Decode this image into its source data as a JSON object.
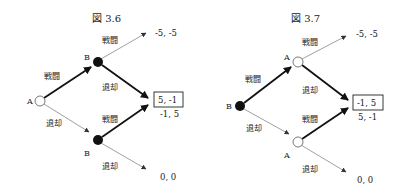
{
  "figures": [
    {
      "title": "図 3.6",
      "root": {
        "label": "A",
        "type": "open"
      },
      "root_edges": [
        {
          "label": "戦闘",
          "bold": true
        },
        {
          "label": "退却",
          "bold": false
        }
      ],
      "upper_node": {
        "label": "B",
        "type": "filled"
      },
      "lower_node": {
        "label": "B",
        "type": "filled"
      },
      "upper_edges": [
        {
          "label": "戦闘",
          "bold": false,
          "payoff": "-5, -5"
        },
        {
          "label": "退却",
          "bold": true,
          "payoff": "5, -1",
          "boxed": true
        }
      ],
      "lower_edges": [
        {
          "label": "戦闘",
          "bold": true,
          "payoff": "-1, 5"
        },
        {
          "label": "退却",
          "bold": false,
          "payoff": "0, 0"
        }
      ]
    },
    {
      "title": "図 3.7",
      "root": {
        "label": "B",
        "type": "filled"
      },
      "root_edges": [
        {
          "label": "戦闘",
          "bold": true
        },
        {
          "label": "退却",
          "bold": false
        }
      ],
      "upper_node": {
        "label": "A",
        "type": "open"
      },
      "lower_node": {
        "label": "A",
        "type": "open"
      },
      "upper_edges": [
        {
          "label": "戦闘",
          "bold": false,
          "payoff": "-5, -5"
        },
        {
          "label": "退却",
          "bold": true,
          "payoff": "-1, 5",
          "boxed": true
        }
      ],
      "lower_edges": [
        {
          "label": "戦闘",
          "bold": true,
          "payoff": "5, -1"
        },
        {
          "label": "退却",
          "bold": false,
          "payoff": "0, 0"
        }
      ]
    }
  ],
  "colors": {
    "line": "#222222",
    "thin_line": "#777777",
    "background": "#ffffff"
  }
}
